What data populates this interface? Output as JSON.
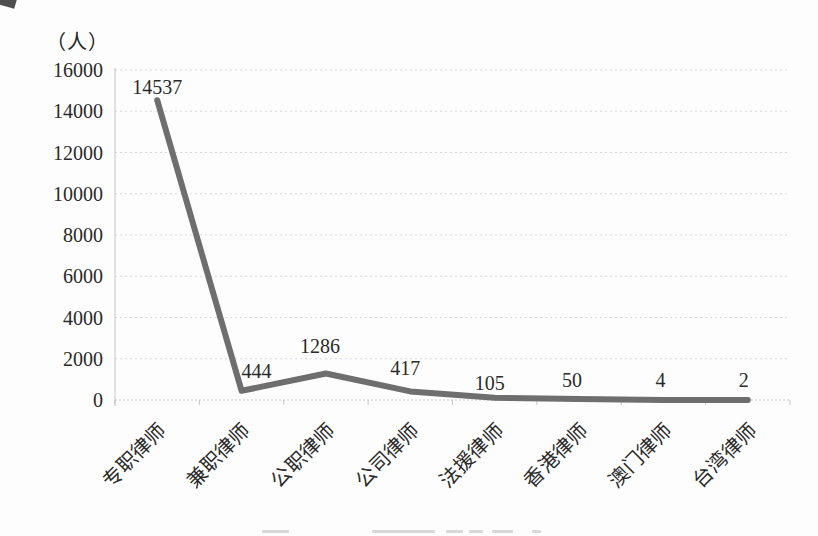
{
  "chart_data": {
    "type": "line",
    "title": "",
    "ylabel": "（人）",
    "xlabel": "",
    "categories": [
      "专职律师",
      "兼职律师",
      "公职律师",
      "公司律师",
      "法援律师",
      "香港律师",
      "澳门律师",
      "台湾律师"
    ],
    "values": [
      14537,
      444,
      1286,
      417,
      105,
      50,
      4,
      2
    ],
    "ylim": [
      0,
      16000
    ],
    "yticks": [
      0,
      2000,
      4000,
      6000,
      8000,
      10000,
      12000,
      14000,
      16000
    ],
    "grid": true,
    "legend_position": "none",
    "line_color": "#6e6e6e",
    "grid_color": "#d9d9d9",
    "axis_color": "#c7c7c7",
    "text_color": "#2a2a2a"
  }
}
